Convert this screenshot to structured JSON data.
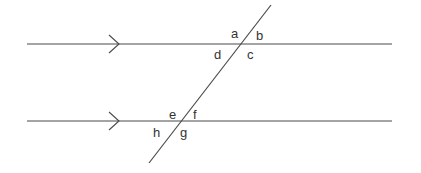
{
  "diagram": {
    "type": "parallel-lines-with-transversal",
    "colors": {
      "stroke": "#4a4a4a",
      "label": "#333333",
      "background": "#ffffff"
    },
    "parallel_lines": [
      {
        "id": "top",
        "x1": 27,
        "y1": 44,
        "x2": 392,
        "y2": 44,
        "arrow_tip": {
          "x": 119,
          "y": 44
        }
      },
      {
        "id": "bottom",
        "x1": 27,
        "y1": 121,
        "x2": 392,
        "y2": 121,
        "arrow_tip": {
          "x": 119,
          "y": 121
        }
      }
    ],
    "transversal": {
      "x1": 271,
      "y1": 5,
      "x2": 149,
      "y2": 163
    },
    "labels": {
      "a": "a",
      "b": "b",
      "c": "c",
      "d": "d",
      "e": "e",
      "f": "f",
      "g": "g",
      "h": "h"
    }
  }
}
